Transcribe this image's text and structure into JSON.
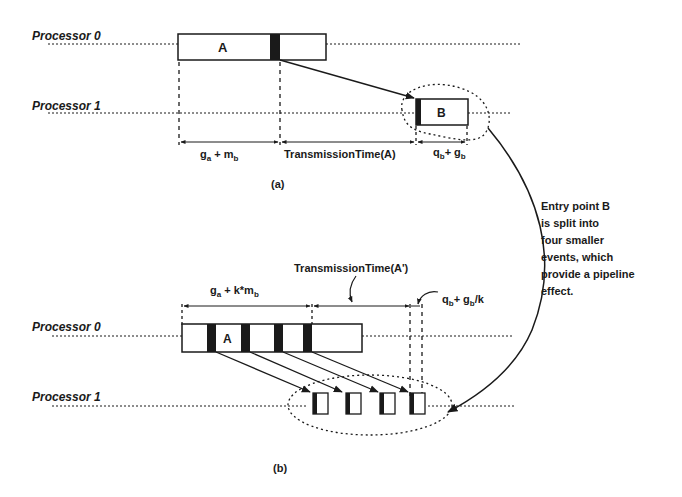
{
  "figure": {
    "part_a": {
      "caption": "(a)",
      "processor_0_label": "Processor 0",
      "processor_1_label": "Processor 1",
      "event_a_label": "A",
      "event_b_label": "B",
      "interval_1": {
        "base": "g",
        "sub1": "a",
        "op": " + m",
        "sub2": "b"
      },
      "interval_2": "TransmissionTime(A)",
      "interval_3": {
        "base": "q",
        "sub1": "b",
        "op": "+ g",
        "sub2": "b"
      }
    },
    "part_b": {
      "caption": "(b)",
      "processor_0_label": "Processor 0",
      "processor_1_label": "Processor 1",
      "event_a_label": "A",
      "interval_1": {
        "base": "g",
        "sub1": "a",
        "op": " + k*m",
        "sub2": "b"
      },
      "interval_2": "TransmissionTime(A')",
      "interval_3": {
        "base": "q",
        "sub1": "b",
        "op": "+ g",
        "sub2": "b",
        "suffix": "/k"
      },
      "split_events_count": 4
    },
    "annotation": {
      "lines": [
        "Entry point B",
        "is split into",
        "four smaller",
        "events, which",
        "provide a pipeline",
        "effect."
      ]
    },
    "colors": {
      "ink": "#1a1a1a",
      "background": "#ffffff"
    }
  }
}
